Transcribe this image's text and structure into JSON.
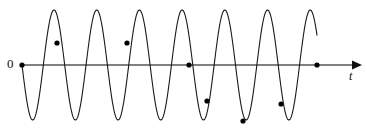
{
  "figure": {
    "title": "",
    "background_color": "#ffffff",
    "width": 367,
    "height": 134
  },
  "labels": {
    "origin": "0",
    "time_axis": "t"
  },
  "colors": {
    "curve": "#1a1a1a",
    "axis": "#808080",
    "arrowhead": "#111111",
    "marker": "#000000"
  },
  "chart_data": {
    "type": "line",
    "title": "",
    "xlabel": "t",
    "ylabel": "",
    "grid": false,
    "legend": null,
    "axis": {
      "baseline_y_px": 65,
      "x_start_px": 22,
      "x_end_px": 358,
      "arrow": "right"
    },
    "waveform": {
      "description": "sinusoid starting at origin and descending first",
      "form": "y = -A*sin(2*pi*x/T)",
      "amplitude_px": 55,
      "period_px": 42.7,
      "cycles": 7,
      "curve_start_px": 22,
      "curve_end_px": 317,
      "peak_y_px": 11,
      "trough_y_px": 121,
      "peaks_x_px": [
        51,
        93,
        136,
        179,
        222,
        265,
        307
      ],
      "troughs_x_px": [
        31,
        73,
        116,
        158,
        200,
        243,
        286
      ]
    },
    "markers": [
      {
        "id": "m0",
        "x_px": 22,
        "y_px": 65,
        "on": "axis"
      },
      {
        "id": "m1",
        "x_px": 57,
        "y_px": 43,
        "on": "rising-edge"
      },
      {
        "id": "m2",
        "x_px": 127,
        "y_px": 43,
        "on": "rising-edge"
      },
      {
        "id": "m3",
        "x_px": 189,
        "y_px": 65,
        "on": "axis"
      },
      {
        "id": "m4",
        "x_px": 207,
        "y_px": 101,
        "on": "falling-edge"
      },
      {
        "id": "m5",
        "x_px": 243,
        "y_px": 121,
        "on": "trough"
      },
      {
        "id": "m6",
        "x_px": 281,
        "y_px": 104,
        "on": "rising-edge"
      },
      {
        "id": "m7",
        "x_px": 317,
        "y_px": 65,
        "on": "axis"
      }
    ]
  }
}
